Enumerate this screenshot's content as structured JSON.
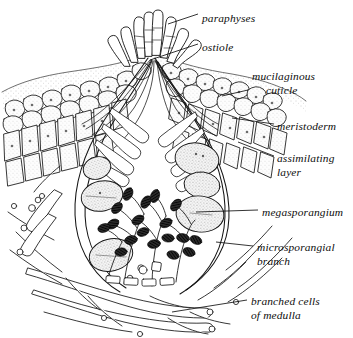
{
  "figure": {
    "background_color": "#ffffff",
    "ink_color": "#111111",
    "stipple_color": "#8a8a8a"
  },
  "labels": [
    {
      "id": "paraphyses",
      "text": "paraphyses",
      "line2": "",
      "x": 202,
      "y": 18,
      "leader": [
        [
          198,
          14
        ],
        [
          168,
          24
        ]
      ]
    },
    {
      "id": "ostiole",
      "text": "ostiole",
      "line2": "",
      "x": 202,
      "y": 48,
      "leader": [
        [
          198,
          44
        ],
        [
          150,
          60
        ]
      ]
    },
    {
      "id": "mucilaginous",
      "text": "mucilaginous",
      "line2": "cuticle",
      "x": 252,
      "y": 82,
      "leader": [
        [
          248,
          90
        ],
        [
          222,
          96
        ]
      ]
    },
    {
      "id": "meristoderm",
      "text": "meristoderm",
      "line2": "",
      "x": 277,
      "y": 128,
      "leader": [
        [
          274,
          124
        ],
        [
          232,
          118
        ]
      ]
    },
    {
      "id": "assimilating",
      "text": "assimilating",
      "line2": "layer",
      "x": 277,
      "y": 160,
      "leader": [
        [
          274,
          156
        ],
        [
          238,
          142
        ]
      ]
    },
    {
      "id": "megasporangium",
      "text": "megasporangium",
      "line2": "",
      "x": 262,
      "y": 214,
      "leader": [
        [
          258,
          210
        ],
        [
          196,
          212
        ]
      ]
    },
    {
      "id": "microsporangial",
      "text": "microsporangial",
      "line2": "branch",
      "x": 257,
      "y": 249,
      "leader": [
        [
          253,
          246
        ],
        [
          216,
          242
        ]
      ]
    },
    {
      "id": "medulla",
      "text": "branched cells",
      "line2": "of medulla",
      "x": 251,
      "y": 303,
      "leader": [
        [
          247,
          300
        ],
        [
          172,
          312
        ]
      ]
    }
  ],
  "structures": {
    "paraphyses_label": "paraphyses",
    "ostiole_label": "ostiole",
    "mucilaginous_cuticle_label": "mucilaginous cuticle",
    "meristoderm_label": "meristoderm",
    "assimilating_layer_label": "assimilating layer",
    "megasporangium_label": "megasporangium",
    "microsporangial_branch_label": "microsporangial branch",
    "branched_cells_of_medulla_label": "branched cells of medulla"
  }
}
